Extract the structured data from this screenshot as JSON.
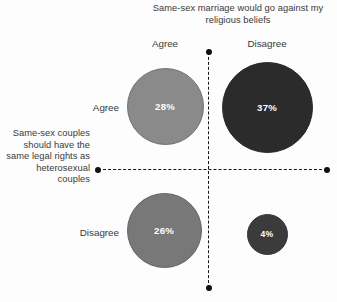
{
  "chart_data": {
    "type": "bubble",
    "title": "",
    "xlabel": "Same-sex marriage would go against my religious beliefs",
    "ylabel": "Same-sex couples should have the same legal rights as heterosexual couples",
    "x_categories": [
      "Agree",
      "Disagree"
    ],
    "y_categories": [
      "Agree",
      "Disagree"
    ],
    "grid": false,
    "legend": "none",
    "axis_style": "dashed-crosshair-with-endpoint-dots",
    "points": [
      {
        "id": "agree-agree",
        "x_category": "Agree",
        "y_category": "Agree",
        "value": 28,
        "label": "28%",
        "color": "#8a8a8a",
        "stroke": "#6f6f6f",
        "diameter_px": 77,
        "cx": 165,
        "cy": 106
      },
      {
        "id": "agree-disagree",
        "x_category": "Disagree",
        "y_category": "Agree",
        "value": 37,
        "label": "37%",
        "color": "#2b2b2b",
        "stroke": "#2b2b2b",
        "diameter_px": 91,
        "cx": 267,
        "cy": 107
      },
      {
        "id": "disagree-agree",
        "x_category": "Agree",
        "y_category": "Disagree",
        "value": 26,
        "label": "26%",
        "color": "#787878",
        "stroke": "#636363",
        "diameter_px": 75,
        "cx": 164,
        "cy": 230
      },
      {
        "id": "disagree-disagree",
        "x_category": "Disagree",
        "y_category": "Disagree",
        "value": 4,
        "label": "4%",
        "color": "#3b3b3b",
        "stroke": "#3b3b3b",
        "diameter_px": 41,
        "cx": 267,
        "cy": 234
      }
    ]
  },
  "colors": {
    "background": "#fdfdfd",
    "axis": "#151515",
    "text": "#3a3a3a",
    "bubble_text": "#ffffff"
  },
  "axes": {
    "column": {
      "title": "Same-sex marriage would go against my religious beliefs",
      "ticks": [
        "Agree",
        "Disagree"
      ]
    },
    "row": {
      "title": "Same-sex couples should have the same legal rights as heterosexual couples",
      "ticks": [
        "Agree",
        "Disagree"
      ]
    }
  }
}
